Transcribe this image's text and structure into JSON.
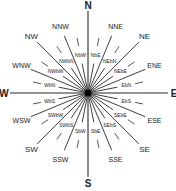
{
  "diagram": {
    "type": "compass-rose",
    "points": 32,
    "center": {
      "x": 88,
      "y": 93
    },
    "colors": {
      "line": "#2a2a2a",
      "text": "#222222",
      "background": "#ffffff",
      "hub": "#000000"
    },
    "cardinal": [
      {
        "label": "N",
        "angle": 0
      },
      {
        "label": "E",
        "angle": 90
      },
      {
        "label": "S",
        "angle": 180
      },
      {
        "label": "W",
        "angle": 270
      }
    ],
    "intercardinal": [
      {
        "label": "NE",
        "angle": 45
      },
      {
        "label": "SE",
        "angle": 135
      },
      {
        "label": "SW",
        "angle": 225
      },
      {
        "label": "NW",
        "angle": 315
      }
    ],
    "half_winds": [
      {
        "label": "NNE",
        "angle": 22.5
      },
      {
        "label": "ENE",
        "angle": 67.5
      },
      {
        "label": "ESE",
        "angle": 112.5
      },
      {
        "label": "SSE",
        "angle": 157.5
      },
      {
        "label": "SSW",
        "angle": 202.5
      },
      {
        "label": "WSW",
        "angle": 247.5
      },
      {
        "label": "WNW",
        "angle": 292.5
      },
      {
        "label": "NNW",
        "angle": 337.5
      }
    ],
    "quarter_winds": [
      {
        "label": "NbE",
        "angle": 11.25
      },
      {
        "label": "NEbN",
        "angle": 33.75
      },
      {
        "label": "NEbE",
        "angle": 56.25
      },
      {
        "label": "EbN",
        "angle": 78.75
      },
      {
        "label": "EbS",
        "angle": 101.25
      },
      {
        "label": "SEbE",
        "angle": 123.75
      },
      {
        "label": "SEbS",
        "angle": 146.25
      },
      {
        "label": "SbE",
        "angle": 168.75
      },
      {
        "label": "SbW",
        "angle": 191.25
      },
      {
        "label": "SWbS",
        "angle": 213.75
      },
      {
        "label": "SWbW",
        "angle": 236.25
      },
      {
        "label": "WbS",
        "angle": 258.75
      },
      {
        "label": "WbN",
        "angle": 281.25
      },
      {
        "label": "NWbW",
        "angle": 303.75
      },
      {
        "label": "NWbN",
        "angle": 326.25
      },
      {
        "label": "NbW",
        "angle": 348.75
      }
    ]
  }
}
